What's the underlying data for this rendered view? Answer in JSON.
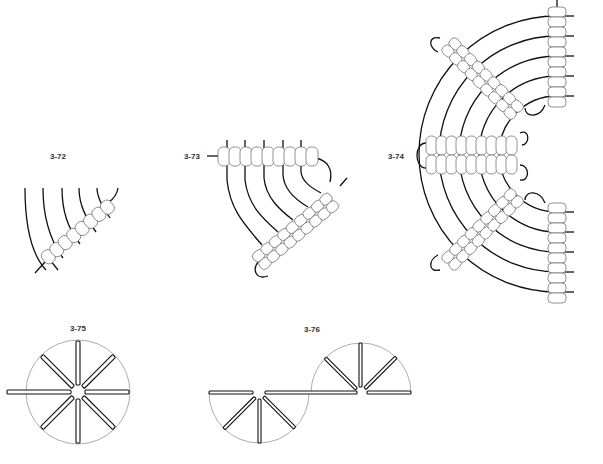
{
  "figures": [
    {
      "id": "3-72",
      "label": "3-72",
      "label_pos": [
        58,
        159
      ]
    },
    {
      "id": "3-73",
      "label": "3-73",
      "label_pos": [
        183,
        159
      ]
    },
    {
      "id": "3-74",
      "label": "3-74",
      "label_pos": [
        387,
        159
      ]
    },
    {
      "id": "3-75",
      "label": "3-75",
      "label_pos": [
        69,
        331
      ]
    },
    {
      "id": "3-76",
      "label": "3-76",
      "label_pos": [
        303,
        332
      ]
    }
  ],
  "colors": {
    "thread": "#111111",
    "bead_outline": "#777777",
    "guide_circle": "#888888",
    "label": "#333333",
    "background": "#ffffff"
  },
  "fig_3_75": {
    "center": [
      78,
      392
    ],
    "radius": 52,
    "spokes": 8
  },
  "fig_3_76": {
    "left_center": [
      259,
      393
    ],
    "right_center": [
      361,
      393
    ],
    "radius": 50
  }
}
